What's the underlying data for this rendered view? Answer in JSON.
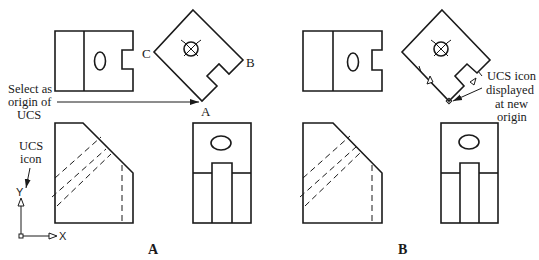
{
  "figure": {
    "panel_a": {
      "caption": "A",
      "vertex_labels": {
        "a": "A",
        "b": "B",
        "c": "C"
      },
      "callout_select": {
        "line1": "Select as",
        "line2": "origin of",
        "line3": "UCS"
      },
      "callout_ucs_icon": {
        "line1": "UCS",
        "line2": "icon"
      },
      "ucs_axes": {
        "x": "X",
        "y": "Y"
      }
    },
    "panel_b": {
      "caption": "B",
      "callout_new_origin": {
        "line1": "UCS icon",
        "line2": "displayed",
        "line3": "at new",
        "line4": "origin"
      }
    },
    "colors": {
      "line": "#1a1a1a",
      "background": "#ffffff"
    }
  }
}
